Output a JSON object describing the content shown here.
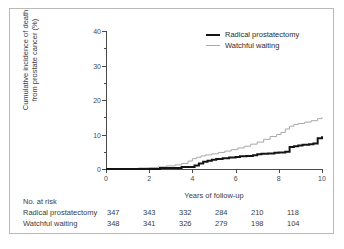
{
  "chart_data": {
    "type": "line",
    "title": "",
    "xlabel": "Years of follow-up",
    "ylabel": "Cumulative incidence of death from prostate cancer (%)",
    "ylabel_line1": "Cumulative incidence of death",
    "ylabel_line2": "from prostate cancer (%)",
    "xlim": [
      0,
      10
    ],
    "ylim": [
      0,
      40
    ],
    "xticks": [
      "0",
      "2",
      "4",
      "6",
      "8",
      "10"
    ],
    "xtick_values": [
      0,
      2,
      4,
      6,
      8,
      10
    ],
    "yticks": [
      "0",
      "10",
      "20",
      "30",
      "40"
    ],
    "ytick_values": [
      0,
      10,
      20,
      30,
      40
    ],
    "yminor_values": [
      5,
      15,
      25,
      35
    ],
    "grid": false,
    "legend_position": "top-right",
    "series": [
      {
        "name": "Radical prostatectomy",
        "color": "#141414",
        "width": 2,
        "x": [
          0,
          2.5,
          3.0,
          3.5,
          3.9,
          4.1,
          4.3,
          4.5,
          4.7,
          4.9,
          5.1,
          5.4,
          5.7,
          6.0,
          6.2,
          6.5,
          6.8,
          7.0,
          7.2,
          7.5,
          7.8,
          8.0,
          8.3,
          8.5,
          8.7,
          8.9,
          9.1,
          9.4,
          9.6,
          9.8,
          10.0
        ],
        "y": [
          0,
          0.3,
          0.3,
          0.6,
          0.6,
          1.0,
          1.6,
          2.1,
          2.4,
          2.7,
          2.9,
          3.1,
          3.3,
          3.5,
          3.7,
          3.8,
          4.0,
          4.3,
          4.4,
          4.5,
          4.7,
          4.8,
          5.0,
          6.4,
          6.6,
          6.8,
          7.0,
          7.2,
          7.4,
          8.9,
          9.5
        ]
      },
      {
        "name": "Watchful waiting",
        "color": "#a8a8a8",
        "width": 1,
        "x": [
          0,
          1.5,
          2.0,
          2.4,
          2.8,
          3.2,
          3.5,
          3.8,
          4.0,
          4.2,
          4.4,
          4.6,
          4.9,
          5.2,
          5.5,
          5.8,
          6.1,
          6.4,
          6.7,
          7.0,
          7.3,
          7.6,
          7.9,
          8.1,
          8.3,
          8.5,
          8.7,
          8.9,
          9.2,
          9.5,
          9.8,
          10.0
        ],
        "y": [
          0,
          0.3,
          0.4,
          0.6,
          0.9,
          1.2,
          1.6,
          2.3,
          3.0,
          3.4,
          3.8,
          4.1,
          4.4,
          4.8,
          5.2,
          5.6,
          6.1,
          6.6,
          7.2,
          7.8,
          8.6,
          9.4,
          10.0,
          10.6,
          11.6,
          12.4,
          12.9,
          13.2,
          13.6,
          14.0,
          14.6,
          15.0
        ]
      }
    ]
  },
  "legend": {
    "items": [
      {
        "label": "Radical prostatectomy",
        "style": "thick-black"
      },
      {
        "label": "Watchful waiting",
        "style": "thin-gray"
      }
    ]
  },
  "risk_table": {
    "title": "No. at risk",
    "rows": [
      {
        "label": "Radical prostatectomy",
        "values": [
          "347",
          "343",
          "332",
          "284",
          "210",
          "118"
        ]
      },
      {
        "label": "Watchful waiting",
        "values": [
          "348",
          "341",
          "326",
          "279",
          "198",
          "104"
        ]
      }
    ]
  },
  "colors": {
    "series_black": "#141414",
    "series_gray": "#a8a8a8",
    "axis": "#4a4a4a",
    "text": "#3b3b3b",
    "frame": "#b9b9b9"
  }
}
